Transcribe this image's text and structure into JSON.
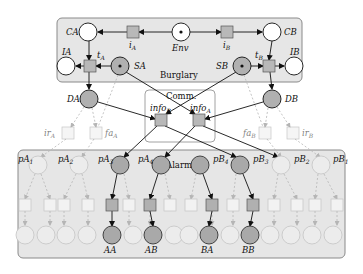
{
  "colors": {
    "group_fill": "#e6e6e6",
    "group_stroke": "#888888",
    "comm_fill": "#ffffff",
    "active_place": "#a9a9a9",
    "active_transition": "#b0b0b0",
    "faded": "#c8c8c8",
    "arc": "#111111"
  },
  "groups": {
    "burglary": "Burglary",
    "comm": "Comm.",
    "alarm": "Alarm"
  },
  "places": {
    "CA": "CA",
    "CB": "CB",
    "Env": "Env",
    "IA": "IA",
    "IB": "IB",
    "SA": "SA",
    "SB": "SB",
    "DA": "DA",
    "DB": "DB"
  },
  "transitions": {
    "iA": {
      "base": "i",
      "sub": "A"
    },
    "iB": {
      "base": "i",
      "sub": "B"
    },
    "tA": {
      "base": "t",
      "sub": "A"
    },
    "tB": {
      "base": "t",
      "sub": "B"
    },
    "infoA": {
      "base": "info",
      "sub": "A"
    },
    "infoB": {
      "base": "info",
      "sub": "B"
    },
    "irA": {
      "base": "ir",
      "sub": "A"
    },
    "faA": {
      "base": "fa",
      "sub": "A"
    },
    "faB": {
      "base": "fa",
      "sub": "B"
    },
    "irB": {
      "base": "ir",
      "sub": "B"
    }
  },
  "alarm_places": [
    {
      "base": "pA",
      "sub": "1"
    },
    {
      "base": "pA",
      "sub": "2"
    },
    {
      "base": "pA",
      "sub": "3"
    },
    {
      "base": "pA",
      "sub": "4"
    },
    {
      "base": "pB",
      "sub": "4"
    },
    {
      "base": "pB",
      "sub": "3"
    },
    {
      "base": "pB",
      "sub": "2"
    },
    {
      "base": "pB",
      "sub": "1"
    }
  ],
  "outputs": {
    "AA": "AA",
    "AB": "AB",
    "BA": "BA",
    "BB": "BB"
  }
}
